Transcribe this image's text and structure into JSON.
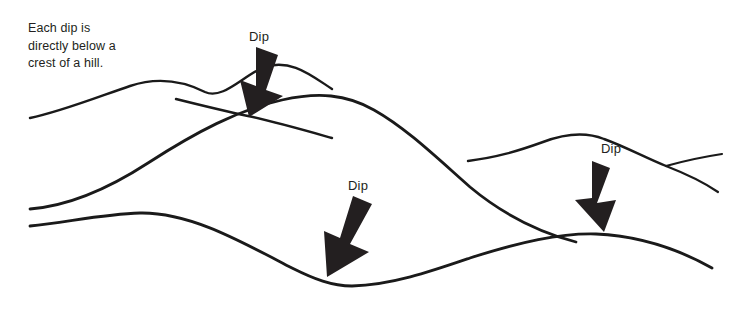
{
  "figure": {
    "title": "Each dip is directly below a crest of a hill.",
    "background_color": "#ffffff",
    "line_color": "#1a1a1a",
    "text_color": "#231f20",
    "arrow_color": "#231f20",
    "width": 733,
    "height": 313
  },
  "caption": {
    "line1": "Each dip is",
    "line2": "directly below a",
    "line3": "crest of a hill.",
    "full_text": "Each dip is\ndirectly below a\ncrest of a hill."
  },
  "annotations": {
    "dip_1": {
      "label": "Dip",
      "x": 249,
      "y": 29
    },
    "dip_2": {
      "label": "Dip",
      "x": 348,
      "y": 178
    },
    "dip_3": {
      "label": "Dip",
      "x": 601,
      "y": 141
    }
  },
  "arrows": [
    {
      "name": "dip-arrow-1",
      "from_x": 264,
      "from_y": 51,
      "to_x": 247,
      "to_y": 113,
      "direction": "down-left"
    },
    {
      "name": "dip-arrow-2",
      "from_x": 351,
      "from_y": 199,
      "to_x": 330,
      "to_y": 275,
      "direction": "down-left"
    },
    {
      "name": "dip-arrow-3",
      "from_x": 586,
      "from_y": 163,
      "to_x": 606,
      "to_y": 228,
      "direction": "down-right"
    }
  ],
  "curves": {
    "upper_surface": "M 30 118 C 60 112 95 98 130 86 C 160 76 185 82 205 92 C 225 101 242 76 262 68 C 290 57 310 78 330 88",
    "small_ridge": "M 176 98 C 200 104 222 110 250 116 C 276 121 300 128 330 136",
    "main_hill": "M 30 209 C 70 205 110 188 150 162 C 200 131 240 110 285 100 C 320 93 345 94 372 108 C 405 126 435 155 470 185 C 505 215 540 232 575 241",
    "right_hill_top": "M 470 160 C 500 156 520 151 545 142 C 565 135 585 132 605 139 C 625 146 645 158 665 166",
    "right_hill_tail_up": "M 665 166 C 685 162 705 158 722 155",
    "right_hill_tail_down": "M 665 166 C 685 172 703 180 718 191",
    "lower_surface": "M 30 226 C 70 222 105 214 140 213 C 190 212 240 240 290 266 C 315 278 330 285 350 286 C 390 286 430 272 470 259 C 520 243 560 234 596 234 C 640 235 680 250 712 268"
  },
  "colors": {
    "ink": "#1a1a1a",
    "text": "#231f20",
    "arrow": "#231f20",
    "background": "#ffffff"
  }
}
